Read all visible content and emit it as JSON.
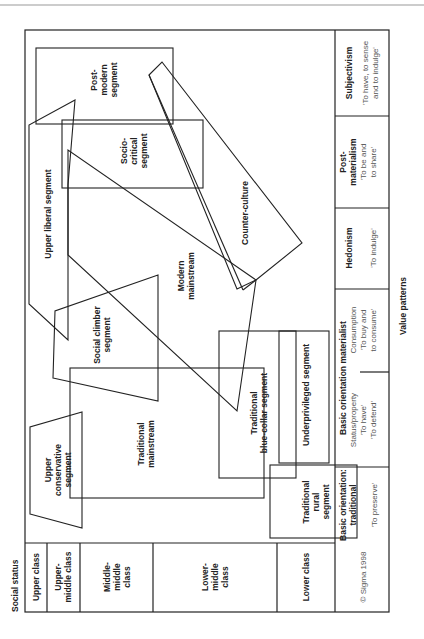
{
  "figure": {
    "orientation": "rotated-90-ccw",
    "axis_y_label": "Social status",
    "axis_x_label": "Value patterns",
    "copyright": "© Sigma 1998",
    "social_status_classes": [
      {
        "label": "Upper class"
      },
      {
        "label": "Upper-\nmiddle class",
        "lines": [
          "Upper-",
          "middle class"
        ]
      },
      {
        "label": "Middle-middle class",
        "lines": [
          "Middle-",
          "middle",
          "class"
        ]
      },
      {
        "label": "Lower-middle class",
        "lines": [
          "Lower-",
          "middle",
          "class"
        ]
      },
      {
        "label": "Lower class"
      }
    ],
    "value_patterns": [
      {
        "title_lines": [
          "Basic orientation:",
          "traditional"
        ],
        "sub_lines": [
          "'To preserve'"
        ]
      },
      {
        "title_lines": [
          "Basic orientation materialist"
        ],
        "left_lines": [
          "Status/property",
          "'To have'",
          "'To defend'"
        ],
        "right_lines": [
          "Consumption",
          "'To buy and",
          "to consume'"
        ]
      },
      {
        "title_lines": [
          "Hedonism"
        ],
        "sub_lines": [
          "'To indulge'"
        ]
      },
      {
        "title_lines": [
          "Post-",
          "materialism"
        ],
        "sub_lines": [
          "'To be and",
          "to share'"
        ]
      },
      {
        "title_lines": [
          "Subjectivism"
        ],
        "sub_lines": [
          "'To have, to sense",
          "and to indulge'"
        ]
      }
    ],
    "segments": [
      {
        "name": "Upper conservative segment",
        "lines": [
          "Upper",
          "conservative",
          "segment"
        ]
      },
      {
        "name": "Traditional mainstream",
        "lines": [
          "Traditional",
          "mainstream"
        ]
      },
      {
        "name": "Traditional rural segment",
        "lines": [
          "Traditional",
          "rural",
          "segment"
        ]
      },
      {
        "name": "Social climber segment",
        "lines": [
          "Social climber",
          "segment"
        ]
      },
      {
        "name": "Modern mainstream",
        "lines": [
          "Modern",
          "mainstream"
        ]
      },
      {
        "name": "Traditional blue-collar segment",
        "lines": [
          "Traditional",
          "blue-collar segment"
        ]
      },
      {
        "name": "Underprivileged segment",
        "lines": [
          "Underprivileged segment"
        ]
      },
      {
        "name": "Upper liberal segment",
        "lines": [
          "Upper liberal segment"
        ]
      },
      {
        "name": "Socio-critical segment",
        "lines": [
          "Socio-",
          "critical",
          "segment"
        ]
      },
      {
        "name": "Post-modern segment",
        "lines": [
          "Post-",
          "modern",
          "segment"
        ]
      },
      {
        "name": "Counter-culture",
        "lines": [
          "Counter-culture"
        ]
      }
    ]
  }
}
